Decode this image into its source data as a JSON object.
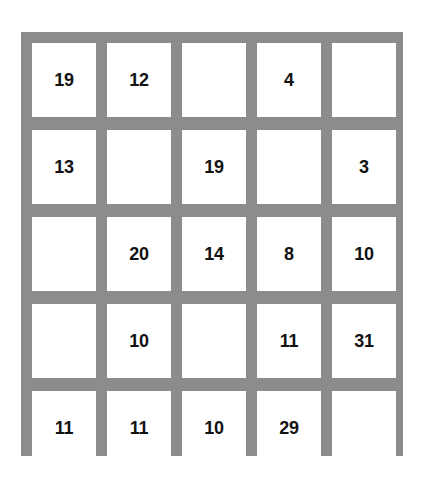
{
  "board": {
    "rows": 5,
    "columns": 5,
    "border_color": "#8c8c8c",
    "cell_color": "#ffffff",
    "value_color": "#121212",
    "background_color": "#ffffff"
  },
  "chart_data": {
    "type": "table",
    "title": "",
    "xlabel": "",
    "ylabel": "",
    "grid": true,
    "legend": "none",
    "rows": 5,
    "columns": 5,
    "cells": [
      [
        "19",
        "12",
        "",
        "4",
        ""
      ],
      [
        "13",
        "",
        "19",
        "",
        "3"
      ],
      [
        "",
        "20",
        "14",
        "8",
        "10"
      ],
      [
        "",
        "10",
        "",
        "11",
        "31"
      ],
      [
        "11",
        "11",
        "10",
        "29",
        ""
      ]
    ],
    "values": [
      19,
      12,
      null,
      4,
      null,
      13,
      null,
      19,
      null,
      3,
      null,
      20,
      14,
      8,
      10,
      null,
      10,
      null,
      11,
      31,
      11,
      11,
      10,
      29,
      null
    ],
    "filled_count": 16,
    "empty_count": 9
  }
}
